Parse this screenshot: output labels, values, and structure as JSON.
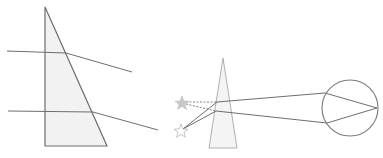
{
  "diagram": {
    "colors": {
      "stroke": "#6e6e6e",
      "prism_fill": "#f2f2f2",
      "star_fill": "#c8c8c8",
      "star_outline": "#b5b5b5",
      "eye_stroke": "#7a7a7a"
    },
    "left_prism": {
      "points": "45,7 45,146 107,146",
      "rays": [
        {
          "incident": [
            7,
            51,
            66,
            53
          ],
          "refracted": [
            66,
            53,
            132,
            72
          ]
        },
        {
          "incident": [
            8,
            111,
            93,
            112
          ],
          "refracted": [
            93,
            112,
            158,
            130
          ]
        }
      ]
    },
    "right_prism": {
      "points": "223,58 209,148 237,148"
    },
    "stars": [
      {
        "name": "apparent-star",
        "cx": 182,
        "cy": 103,
        "filled": true
      },
      {
        "name": "real-star",
        "cx": 181,
        "cy": 131,
        "filled": false
      }
    ],
    "eye": {
      "cx": 350,
      "cy": 108,
      "r": 28
    },
    "eye_rays": [
      [
        217,
        102,
        325,
        93,
        377,
        108
      ],
      [
        216,
        111,
        327,
        123,
        377,
        108
      ]
    ]
  }
}
